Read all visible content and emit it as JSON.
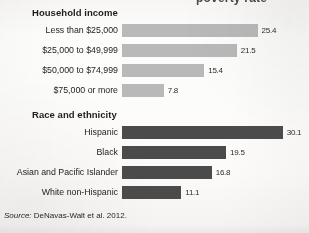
{
  "page": {
    "cut_off_title_fragment": "poverty rate",
    "source_prefix": "Source:",
    "source_text": "DeNavas-Walt et al. 2012."
  },
  "colors": {
    "background": "#fbfaf9",
    "text": "#231f20",
    "bar_light": "#b9b9b9",
    "bar_dark": "#4b4b4b"
  },
  "chart_data": [
    {
      "type": "bar",
      "orientation": "horizontal",
      "title": "Household income",
      "xlabel": "",
      "ylabel": "",
      "xlim": [
        0,
        34
      ],
      "grid": false,
      "legend": "none",
      "bar_color": "#b9b9b9",
      "value_format": "one-decimal",
      "categories": [
        "Less than $25,000",
        "$25,000 to $49,999",
        "$50,000 to $74,999",
        "$75,000 or more"
      ],
      "values": [
        25.4,
        21.5,
        15.4,
        7.8
      ],
      "value_labels": [
        "25.4",
        "21.5",
        "15.4",
        "7.8"
      ]
    },
    {
      "type": "bar",
      "orientation": "horizontal",
      "title": "Race and ethnicity",
      "xlabel": "",
      "ylabel": "",
      "xlim": [
        0,
        34
      ],
      "grid": false,
      "legend": "none",
      "bar_color": "#4b4b4b",
      "value_format": "one-decimal",
      "categories": [
        "Hispanic",
        "Black",
        "Asian and Pacific Islander",
        "White non-Hispanic"
      ],
      "values": [
        30.1,
        19.5,
        16.8,
        11.1
      ],
      "value_labels": [
        "30.1",
        "19.5",
        "16.8",
        "11.1"
      ]
    }
  ]
}
